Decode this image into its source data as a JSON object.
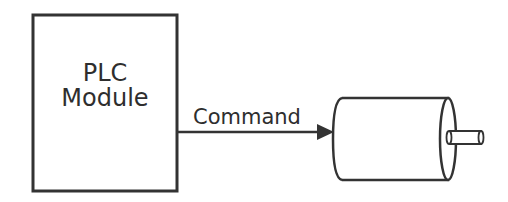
{
  "diagram": {
    "plc_module": {
      "line1": "PLC",
      "line2": "Module"
    },
    "connection": {
      "label": "Command",
      "direction": "plc-to-motor"
    },
    "motor": {
      "shape": "cylinder-with-shaft"
    },
    "colors": {
      "stroke": "#333333",
      "background": "#ffffff",
      "text": "#2e2e2e"
    }
  }
}
